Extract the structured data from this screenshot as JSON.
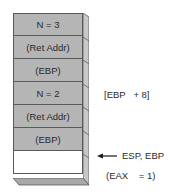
{
  "stack": {
    "cells": [
      {
        "label": "N = 3"
      },
      {
        "label": "(Ret Addr)"
      },
      {
        "label": "(EBP)"
      },
      {
        "label": "N = 2"
      },
      {
        "label": "(Ret Addr)"
      },
      {
        "label": "(EBP)"
      },
      {
        "label": ""
      }
    ]
  },
  "annotations": {
    "ebp_offset": "[EBP   + 8]",
    "esp_ebp": "ESP, EBP",
    "eax": "(EAX    = 1)"
  },
  "colors": {
    "cell_fill": "#b5b5b5",
    "empty_fill": "#ffffff",
    "border": "#5a5a5a",
    "side_fill": "#c8c8c8"
  }
}
